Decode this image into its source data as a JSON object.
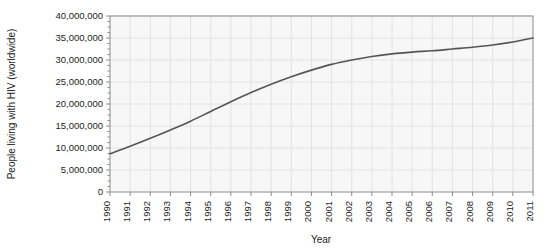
{
  "chart_data": {
    "type": "line",
    "title": "",
    "xlabel": "Year",
    "ylabel": "People living with HIV (worldwide)",
    "xlim": [
      1990,
      2011
    ],
    "ylim": [
      0,
      40000000
    ],
    "grid": true,
    "legend": "none",
    "y_tick_labels": [
      "40,000,000",
      "35,000,000",
      "30,000,000",
      "25,000,000",
      "20,000,000",
      "15,000,000",
      "10,000,000",
      "5,000,000",
      "0"
    ],
    "y_tick_values": [
      40000000,
      35000000,
      30000000,
      25000000,
      20000000,
      15000000,
      10000000,
      5000000,
      0
    ],
    "y_minor_tick_interval": 1250000,
    "x_tick_labels": [
      "1990",
      "1991",
      "1992",
      "1993",
      "1994",
      "1995",
      "1996",
      "1997",
      "1998",
      "1999",
      "2000",
      "2001",
      "2002",
      "2003",
      "2004",
      "2005",
      "2006",
      "2007",
      "2008",
      "2009",
      "2010",
      "2011"
    ],
    "categories": [
      1990,
      1991,
      1992,
      1993,
      1994,
      1995,
      1996,
      1997,
      1998,
      1999,
      2000,
      2001,
      2002,
      2003,
      2004,
      2005,
      2006,
      2007,
      2008,
      2009,
      2010,
      2011
    ],
    "series": [
      {
        "name": "People living with HIV (worldwide)",
        "color": "#555555",
        "values": [
          8700000,
          10400000,
          12200000,
          14100000,
          16100000,
          18300000,
          20500000,
          22600000,
          24500000,
          26200000,
          27700000,
          29000000,
          30000000,
          30800000,
          31400000,
          31800000,
          32100000,
          32500000,
          32900000,
          33400000,
          34100000,
          35000000
        ]
      }
    ],
    "style": {
      "plot_background": "#f7f7f7",
      "grid_color": "#e2e2e2",
      "frame_color": "#8c8c8c",
      "line_color": "#555555",
      "line_width": 1.6,
      "text_color": "#1d1d1d"
    }
  }
}
